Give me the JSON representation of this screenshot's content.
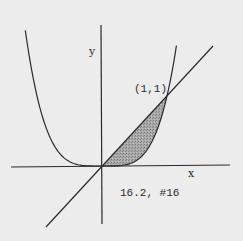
{
  "figure": {
    "caption": "16.2, #16",
    "axis_labels": {
      "x": "x",
      "y": "y"
    },
    "point_label": "(1,1)",
    "curves": [
      {
        "name": "quartic",
        "equation": "y = x^4"
      },
      {
        "name": "line",
        "equation": "y = x"
      }
    ],
    "shaded_region": "between y = x and y = x^4 for 0 <= x <= 1",
    "colors": {
      "background": "#ececec",
      "stroke": "#2a2a2a",
      "shade": "#9a9a9a"
    }
  }
}
